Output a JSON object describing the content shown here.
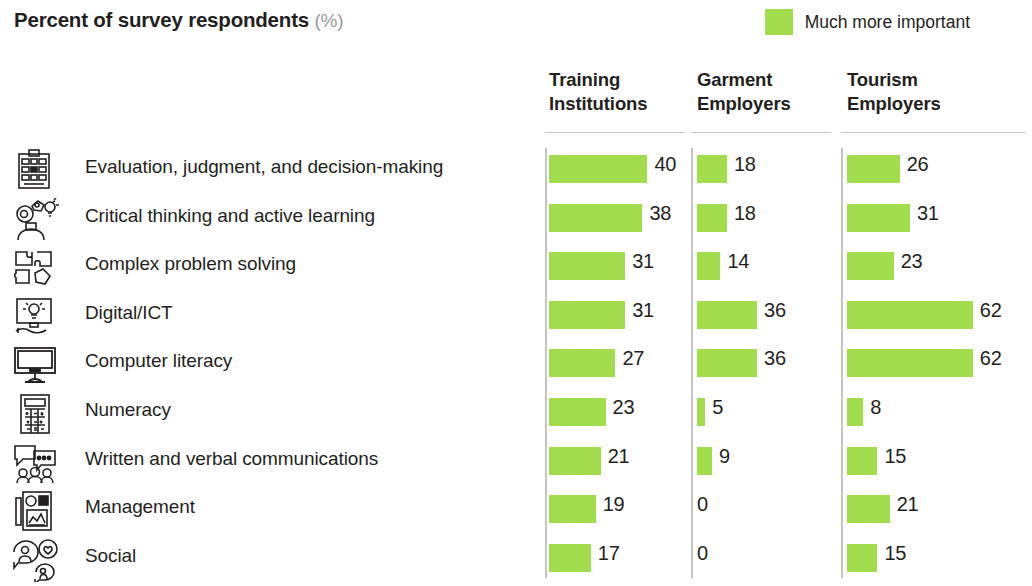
{
  "header": {
    "title": "Percent of survey respondents",
    "unit": "(%)"
  },
  "legend": {
    "swatch_color": "#A2DD4E",
    "label": "Much more important"
  },
  "chart_data": {
    "type": "bar",
    "title": "Percent of survey respondents (%)",
    "xlabel": "",
    "ylabel": "",
    "orientation": "horizontal",
    "grid": false,
    "legend_position": "top-right",
    "legend_entries": [
      "Much more important"
    ],
    "bar_color": "#A2DD4E",
    "categories": [
      "Evaluation, judgment, and decision-making",
      "Critical thinking and active learning",
      "Complex problem solving",
      "Digital/ICT",
      "Computer literacy",
      "Numeracy",
      "Written and verbal communications",
      "Management",
      "Social"
    ],
    "category_icons": [
      "clipboard-checklist-icon",
      "head-gears-lightbulb-icon",
      "puzzle-pieces-icon",
      "monitor-lightbulb-icon",
      "desktop-monitor-icon",
      "calculator-icon",
      "speech-bubbles-people-icon",
      "presentation-board-icon",
      "people-heart-bubbles-icon"
    ],
    "series": [
      {
        "name": "Training Institutions",
        "name_lines": [
          "Training",
          "Institutions"
        ],
        "values": [
          40,
          38,
          31,
          31,
          27,
          23,
          21,
          19,
          17
        ]
      },
      {
        "name": "Garment Employers",
        "name_lines": [
          "Garment",
          "Employers"
        ],
        "values": [
          18,
          18,
          14,
          36,
          36,
          5,
          9,
          0,
          0
        ]
      },
      {
        "name": "Tourism Employers",
        "name_lines": [
          "Tourism",
          "Employers"
        ],
        "values": [
          26,
          31,
          23,
          62,
          62,
          8,
          15,
          21,
          15
        ]
      }
    ]
  }
}
